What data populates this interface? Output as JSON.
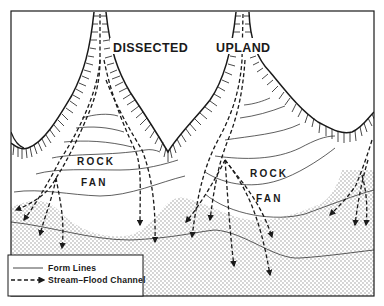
{
  "diagram": {
    "type": "physiographic sketch",
    "labels": {
      "dissected": "DISSECTED",
      "upland": "UPLAND",
      "rock_left": "ROCK",
      "fan_left": "FAN",
      "rock_right": "ROCK",
      "fan_right": "FAN"
    },
    "legend": {
      "form_lines": "Form Lines",
      "stream_flood_channel": "Stream–Flood Channel"
    },
    "colors": {
      "ink": "#1a1a1a",
      "background": "#ffffff",
      "stipple": "#8a8a8a"
    }
  }
}
